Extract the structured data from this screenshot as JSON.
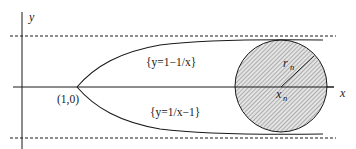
{
  "diagram": {
    "axes": {
      "x_label": "x",
      "y_label": "y"
    },
    "point_label": "(1,0)",
    "curves": {
      "upper_label": "{y=1−1/x}",
      "lower_label": "{y=1/x−1}"
    },
    "circle": {
      "radius_label": "r",
      "radius_subscript": "n",
      "center_label": "x",
      "center_subscript": "n"
    },
    "colors": {
      "stroke": "#1a1a1a",
      "hatch": "#555555",
      "fill": "#e6e6e6"
    }
  }
}
